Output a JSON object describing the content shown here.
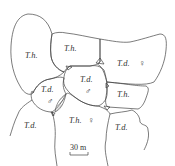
{
  "diagram": {
    "type": "territory-map",
    "territories": [
      {
        "id": "t1",
        "label": "T.h.",
        "sex": ""
      },
      {
        "id": "t2",
        "label": "T.h.",
        "sex": ""
      },
      {
        "id": "t3",
        "label": "T.d.",
        "sex": "♀"
      },
      {
        "id": "t4",
        "label": "T.d.",
        "sex": "♂"
      },
      {
        "id": "t5",
        "label": "T.d.",
        "sex": "♂"
      },
      {
        "id": "t6",
        "label": "T.h.",
        "sex": ""
      },
      {
        "id": "t7",
        "label": "T.h.",
        "sex": "♀"
      },
      {
        "id": "t8",
        "label": "T.d.",
        "sex": ""
      },
      {
        "id": "t9",
        "label": "T.d.",
        "sex": ""
      }
    ],
    "scale_bar": {
      "label": "30 m"
    }
  }
}
